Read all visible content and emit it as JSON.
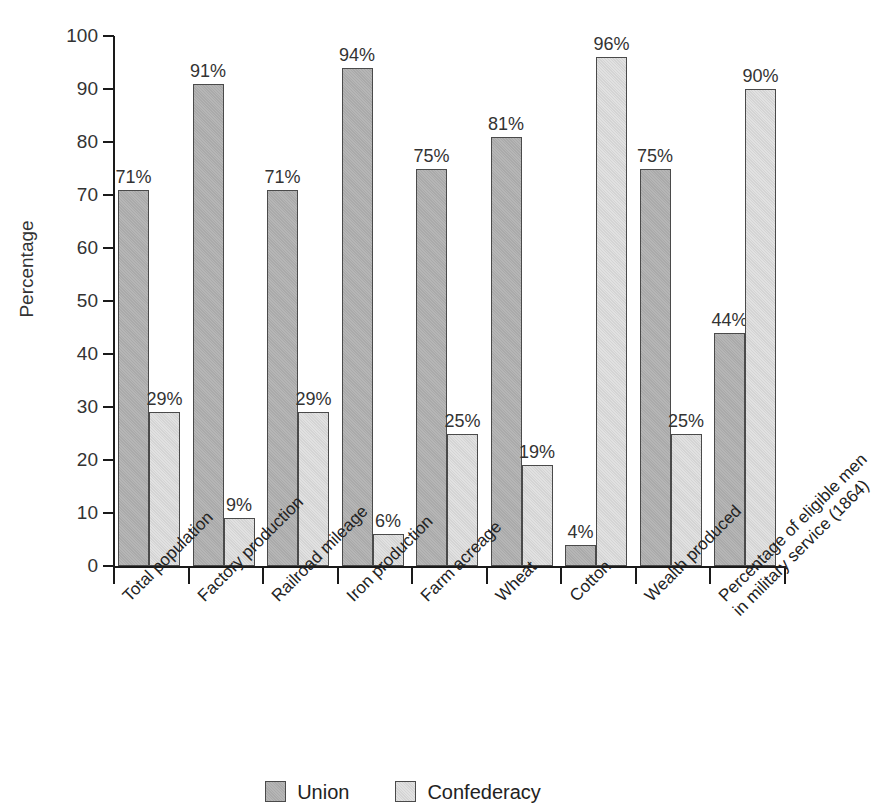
{
  "chart_data": {
    "type": "bar",
    "title": "",
    "xlabel": "",
    "ylabel": "Percentage",
    "ylim": [
      0,
      100
    ],
    "ytick_step": 10,
    "grid": false,
    "legend_position": "bottom-center",
    "value_label_suffix": "%",
    "categories": [
      "Total population",
      "Factory production",
      "Railroad mileage",
      "Iron production",
      "Farm acreage",
      "Wheat",
      "Cotton",
      "Wealth produced",
      "Percentage of eligible men in military service (1864)"
    ],
    "category_lines": [
      [
        "Total population"
      ],
      [
        "Factory production"
      ],
      [
        "Railroad mileage"
      ],
      [
        "Iron production"
      ],
      [
        "Farm acreage"
      ],
      [
        "Wheat"
      ],
      [
        "Cotton"
      ],
      [
        "Wealth produced"
      ],
      [
        "Percentage of eligible men",
        "in military service (1864)"
      ]
    ],
    "series": [
      {
        "name": "Union",
        "color": "#aaaaaa",
        "values": [
          71,
          91,
          71,
          94,
          75,
          81,
          4,
          75,
          44
        ],
        "value_labels": [
          "71%",
          "91%",
          "71%",
          "94%",
          "75%",
          "81%",
          "4%",
          "75%",
          "44%"
        ]
      },
      {
        "name": "Confederacy",
        "color": "#d4d4d4",
        "values": [
          29,
          9,
          29,
          6,
          25,
          19,
          96,
          25,
          90
        ],
        "value_labels": [
          "29%",
          "9%",
          "29%",
          "6%",
          "25%",
          "19%",
          "96%",
          "25%",
          "90%"
        ]
      }
    ],
    "ytick_labels": [
      "0",
      "10",
      "20",
      "30",
      "40",
      "50",
      "60",
      "70",
      "80",
      "90",
      "100"
    ]
  },
  "legend": {
    "items": [
      {
        "label": "Union",
        "series": "union"
      },
      {
        "label": "Confederacy",
        "series": "confed"
      }
    ]
  }
}
